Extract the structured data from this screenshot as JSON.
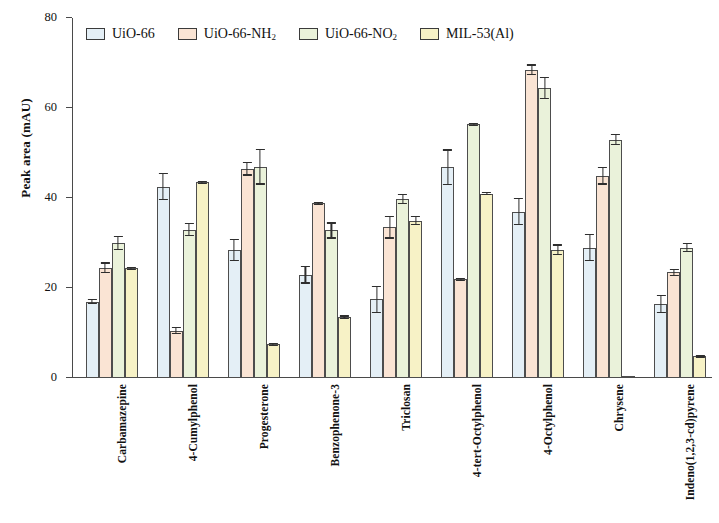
{
  "chart_data": {
    "type": "bar",
    "title": "",
    "xlabel": "",
    "ylabel": "Peak area (mAU)",
    "ylim": [
      0,
      80
    ],
    "yticks": [
      0,
      20,
      40,
      60,
      80
    ],
    "grid": false,
    "legend_position": "top-left inside",
    "categories": [
      "Carbamazepine",
      "4-Cumylphenol",
      "Progesterone",
      "Benzophenone-3",
      "Triclosan",
      "4-tert-Octylphenol",
      "4-Octylphenol",
      "Chrysene",
      "Indeno(1,2,3-cd)pyrene"
    ],
    "series": [
      {
        "name": "UiO-66",
        "color": "#e4eff6",
        "values": [
          17.0,
          42.5,
          28.5,
          23.0,
          17.5,
          46.8,
          37.0,
          29.0,
          16.5
        ],
        "errors": [
          0.6,
          3.0,
          2.5,
          2.0,
          3.0,
          4.0,
          3.0,
          3.0,
          2.0
        ]
      },
      {
        "name": "UiO-66-NH2",
        "color": "#fae4d4",
        "values": [
          24.5,
          10.5,
          46.5,
          38.8,
          33.5,
          22.0,
          68.5,
          45.0,
          23.5
        ],
        "errors": [
          1.2,
          0.8,
          1.5,
          0.4,
          2.5,
          0.0,
          1.2,
          2.0,
          0.8
        ]
      },
      {
        "name": "UiO-66-NO2",
        "color": "#eaf2da",
        "values": [
          30.0,
          33.0,
          47.0,
          32.8,
          39.8,
          56.5,
          64.5,
          53.0,
          29.0
        ],
        "errors": [
          1.6,
          1.5,
          4.0,
          1.8,
          1.2,
          0.0,
          2.5,
          1.2,
          1.0
        ]
      },
      {
        "name": "MIL-53(Al)",
        "color": "#f7f2c6",
        "values": [
          24.5,
          43.5,
          7.5,
          13.5,
          35.0,
          41.0,
          28.5,
          0.3,
          4.8
        ],
        "errors": [
          0.0,
          0.0,
          0.0,
          0.4,
          1.0,
          0.4,
          1.2,
          0.0,
          0.0
        ]
      }
    ],
    "legend": [
      {
        "label": "UiO-66",
        "sub": "",
        "tail": "",
        "color": "#e4eff6"
      },
      {
        "label": "UiO-66-NH",
        "sub": "2",
        "tail": "",
        "color": "#fae4d4"
      },
      {
        "label": "UiO-66-NO",
        "sub": "2",
        "tail": "",
        "color": "#eaf2da"
      },
      {
        "label": "MIL-53(Al)",
        "sub": "",
        "tail": "",
        "color": "#f7f2c6"
      }
    ]
  }
}
